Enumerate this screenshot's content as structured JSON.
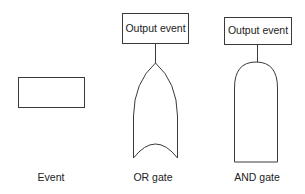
{
  "diagram": {
    "type": "fault-tree-symbol-legend",
    "symbols": [
      {
        "id": "event",
        "shape": "rectangle",
        "label": "Event"
      },
      {
        "id": "or-gate",
        "shape": "or-gate",
        "label": "OR gate",
        "output_box": "Output event"
      },
      {
        "id": "and-gate",
        "shape": "and-gate",
        "label": "AND gate",
        "output_box": "Output event"
      }
    ],
    "colors": {
      "stroke": "#3a3a3a",
      "text": "#222222",
      "background": "#ffffff"
    }
  }
}
